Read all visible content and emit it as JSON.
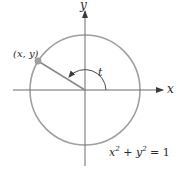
{
  "diagram": {
    "axes": {
      "x_label": "x",
      "y_label": "y"
    },
    "point_label": "(x, y)",
    "angle_label": "t",
    "equation": {
      "x_term": "x",
      "x_exp": "2",
      "plus": " + ",
      "y_term": "y",
      "y_exp": "2",
      "rhs": " = 1"
    },
    "colors": {
      "circle": "#a0a0a0",
      "axes": "#4a4a4a",
      "radius_line": "#8a8a8a",
      "point": "#a0a0a0",
      "text": "#2a2a2a"
    }
  }
}
